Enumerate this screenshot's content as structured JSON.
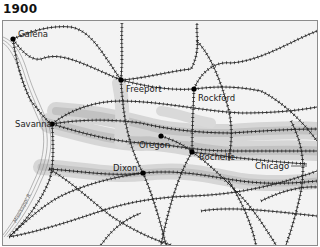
{
  "title": "1900",
  "map": {
    "background": "#f3f3f3",
    "border_color": "#8c8c8c",
    "rail_color": "#222222",
    "corridor_color_outer": "#cfcfcf",
    "corridor_color_inner": "#b5b5b5",
    "river": {
      "label": "Mississippi R.",
      "color": "#8a8a8a"
    },
    "cities": [
      {
        "name": "Galena",
        "label": "Galena",
        "x": 12,
        "y": 38
      },
      {
        "name": "Freeport",
        "label": "Freeport",
        "x": 120,
        "y": 79
      },
      {
        "name": "Rockford",
        "label": "Rockford",
        "x": 193,
        "y": 88
      },
      {
        "name": "Savanna",
        "label": "Savanna",
        "x": 51,
        "y": 123
      },
      {
        "name": "Oregon",
        "label": "Oregon",
        "x": 160,
        "y": 135
      },
      {
        "name": "Rochelle",
        "label": "Rochelle",
        "x": 191,
        "y": 151
      },
      {
        "name": "Dixon",
        "label": "Dixon",
        "x": 142,
        "y": 172
      },
      {
        "name": "Chicago",
        "label": "Chicago",
        "x": 306,
        "y": 163
      }
    ]
  }
}
